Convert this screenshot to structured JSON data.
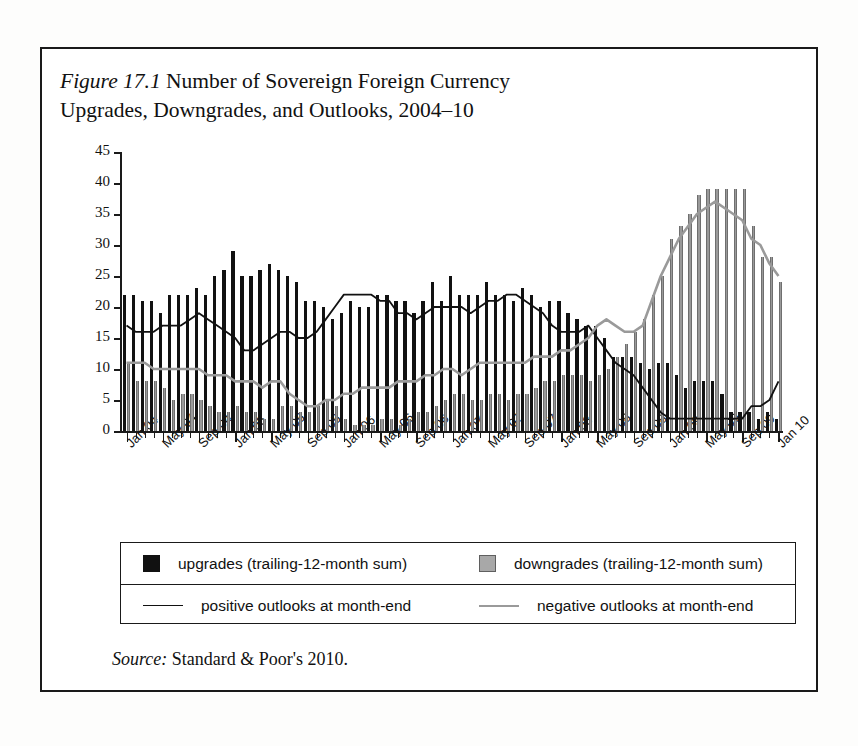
{
  "figure": {
    "number_label": "Figure 17.1",
    "title": "Number of Sovereign Foreign Currency Upgrades, Downgrades, and Outlooks, 2004–10",
    "title_line1": "Number of Sovereign Foreign Currency",
    "title_line2": "Upgrades, Downgrades, and Outlooks, 2004–10",
    "source_label": "Source:",
    "source_text": "Standard & Poor's 2010."
  },
  "legend": {
    "entries": [
      {
        "key": "upgrades",
        "marker": "black-square",
        "label": "upgrades (trailing-12-month sum)"
      },
      {
        "key": "downgrades",
        "marker": "gray-square",
        "label": "downgrades (trailing-12-month sum)"
      },
      {
        "key": "positive",
        "marker": "black-line",
        "label": "positive outlooks at month-end"
      },
      {
        "key": "negative",
        "marker": "gray-line",
        "label": "negative outlooks at month-end"
      }
    ]
  },
  "colors": {
    "upgrades": "#111111",
    "downgrades": "#9a9a9a",
    "positive_outlooks": "#111111",
    "negative_outlooks": "#9a9a9a",
    "frame": "#1a1a1a",
    "background": "#ffffff"
  },
  "chart_data": {
    "type": "bar",
    "title": "Number of Sovereign Foreign Currency Upgrades, Downgrades, and Outlooks, 2004–10",
    "xlabel": "",
    "ylabel": "",
    "ylim": [
      0,
      45
    ],
    "yticks": [
      0,
      5,
      10,
      15,
      20,
      25,
      30,
      35,
      40,
      45
    ],
    "grid": false,
    "legend_position": "below-plot",
    "tick_label_rotation": -45,
    "xtick_labels": [
      "Jan 04",
      "May 04",
      "Sep 04",
      "Jan 05",
      "May 05",
      "Sep 05",
      "Jan 06",
      "May 06",
      "Sep 06",
      "Jan 07",
      "May 07",
      "Sep 07",
      "Jan 08",
      "May 08",
      "Sep 08",
      "Jan 09",
      "May 09",
      "Sep 09",
      "Jan 10"
    ],
    "xtick_interval_months": 4,
    "categories": [
      "Jan 04",
      "Feb 04",
      "Mar 04",
      "Apr 04",
      "May 04",
      "Jun 04",
      "Jul 04",
      "Aug 04",
      "Sep 04",
      "Oct 04",
      "Nov 04",
      "Dec 04",
      "Jan 05",
      "Feb 05",
      "Mar 05",
      "Apr 05",
      "May 05",
      "Jun 05",
      "Jul 05",
      "Aug 05",
      "Sep 05",
      "Oct 05",
      "Nov 05",
      "Dec 05",
      "Jan 06",
      "Feb 06",
      "Mar 06",
      "Apr 06",
      "May 06",
      "Jun 06",
      "Jul 06",
      "Aug 06",
      "Sep 06",
      "Oct 06",
      "Nov 06",
      "Dec 06",
      "Jan 07",
      "Feb 07",
      "Mar 07",
      "Apr 07",
      "May 07",
      "Jun 07",
      "Jul 07",
      "Aug 07",
      "Sep 07",
      "Oct 07",
      "Nov 07",
      "Dec 07",
      "Jan 08",
      "Feb 08",
      "Mar 08",
      "Apr 08",
      "May 08",
      "Jun 08",
      "Jul 08",
      "Aug 08",
      "Sep 08",
      "Oct 08",
      "Nov 08",
      "Dec 08",
      "Jan 09",
      "Feb 09",
      "Mar 09",
      "Apr 09",
      "May 09",
      "Jun 09",
      "Jul 09",
      "Aug 09",
      "Sep 09",
      "Oct 09",
      "Nov 09",
      "Dec 09",
      "Jan 10"
    ],
    "series": [
      {
        "name": "upgrades (trailing-12-month sum)",
        "kind": "bar",
        "color": "#111111",
        "values": [
          22,
          22,
          21,
          21,
          19,
          22,
          22,
          22,
          23,
          22,
          25,
          26,
          29,
          25,
          25,
          26,
          27,
          26,
          25,
          24,
          21,
          21,
          20,
          18,
          19,
          21,
          20,
          20,
          22,
          22,
          21,
          21,
          19,
          21,
          24,
          21,
          25,
          22,
          22,
          22,
          24,
          22,
          22,
          21,
          23,
          22,
          20,
          21,
          21,
          19,
          18,
          17,
          17,
          15,
          12,
          12,
          12,
          11,
          10,
          11,
          11,
          9,
          7,
          8,
          8,
          8,
          6,
          3,
          3,
          3,
          2,
          3,
          2
        ]
      },
      {
        "name": "downgrades (trailing-12-month sum)",
        "kind": "bar",
        "color": "#9a9a9a",
        "values": [
          11,
          8,
          8,
          8,
          7,
          5,
          6,
          6,
          5,
          4,
          3,
          3,
          4,
          3,
          3,
          2,
          2,
          4,
          4,
          3,
          3,
          4,
          5,
          4,
          2,
          1,
          1,
          1,
          2,
          2,
          1,
          2,
          3,
          3,
          4,
          5,
          6,
          6,
          5,
          5,
          6,
          6,
          5,
          6,
          6,
          7,
          8,
          8,
          9,
          9,
          9,
          8,
          9,
          10,
          12,
          14,
          16,
          18,
          22,
          25,
          31,
          33,
          35,
          38,
          39,
          39,
          39,
          39,
          39,
          33,
          28,
          28,
          24
        ]
      },
      {
        "name": "positive outlooks at month-end",
        "kind": "line",
        "color": "#111111",
        "values": [
          17,
          16,
          16,
          16,
          17,
          17,
          17,
          18,
          19,
          18,
          17,
          16,
          15,
          13,
          13,
          14,
          15,
          16,
          16,
          15,
          15,
          16,
          18,
          20,
          22,
          22,
          22,
          22,
          21,
          21,
          19,
          19,
          18,
          19,
          20,
          20,
          20,
          20,
          19,
          20,
          21,
          21,
          22,
          22,
          21,
          20,
          19,
          17,
          16,
          16,
          16,
          17,
          15,
          13,
          11,
          10,
          9,
          7,
          5,
          3,
          2,
          2,
          2,
          2,
          2,
          2,
          2,
          2,
          2,
          4,
          4,
          5,
          8
        ]
      },
      {
        "name": "negative outlooks at month-end",
        "kind": "line",
        "color": "#9a9a9a",
        "values": [
          11,
          11,
          11,
          10,
          10,
          10,
          10,
          10,
          10,
          9,
          9,
          9,
          8,
          8,
          8,
          7,
          8,
          8,
          6,
          5,
          4,
          4,
          5,
          5,
          6,
          6,
          7,
          7,
          7,
          7,
          8,
          8,
          8,
          9,
          9,
          10,
          10,
          9,
          10,
          11,
          11,
          11,
          11,
          11,
          11,
          12,
          12,
          12,
          13,
          13,
          14,
          15,
          17,
          18,
          17,
          16,
          16,
          17,
          21,
          25,
          28,
          31,
          33,
          35,
          36,
          37,
          36,
          35,
          34,
          31,
          30,
          27,
          25
        ]
      }
    ]
  }
}
